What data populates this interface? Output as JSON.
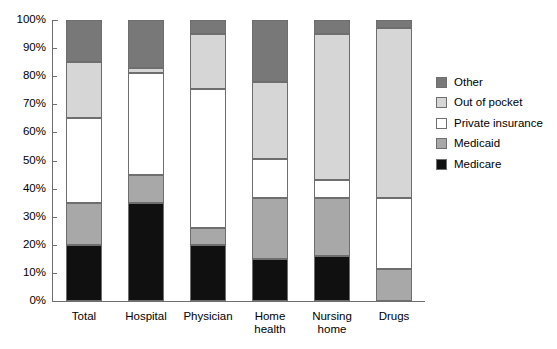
{
  "chart_data": {
    "type": "bar",
    "title": "",
    "subtitle": "",
    "xlabel": "",
    "ylabel": "",
    "stacked": true,
    "stack_total": 100,
    "grid": false,
    "legend_position": "right",
    "ylim": [
      0,
      100
    ],
    "ytick_labels": [
      "100%",
      "90%",
      "80%",
      "70%",
      "60%",
      "50%",
      "40%",
      "30%",
      "20%",
      "10%",
      "0%"
    ],
    "ytick_values": [
      100,
      90,
      80,
      70,
      60,
      50,
      40,
      30,
      20,
      10,
      0
    ],
    "categories": [
      "Total",
      "Hospital",
      "Physician",
      "Home\nhealth",
      "Nursing\nhome",
      "Drugs"
    ],
    "series": [
      {
        "name": "Medicare",
        "color": "#101010",
        "values": [
          20,
          35,
          20,
          15,
          16,
          0
        ]
      },
      {
        "name": "Medicaid",
        "color": "#a8a8a8",
        "values": [
          15,
          10,
          6,
          21.5,
          20.5,
          11.5
        ]
      },
      {
        "name": "Private insurance",
        "color": "#ffffff",
        "values": [
          30,
          36,
          49.5,
          14,
          6.5,
          25
        ]
      },
      {
        "name": "Out of pocket",
        "color": "#d6d6d6",
        "values": [
          20,
          2,
          19.5,
          27.5,
          52,
          60.5
        ]
      },
      {
        "name": "Other",
        "color": "#787878",
        "values": [
          15,
          17,
          5,
          22,
          5,
          3
        ]
      }
    ],
    "legend_order": [
      "Other",
      "Out of pocket",
      "Private insurance",
      "Medicaid",
      "Medicare"
    ]
  },
  "legend": {
    "items": [
      {
        "label": "Other",
        "color": "#787878"
      },
      {
        "label": "Out of pocket",
        "color": "#d6d6d6"
      },
      {
        "label": "Private insurance",
        "color": "#ffffff"
      },
      {
        "label": "Medicaid",
        "color": "#a8a8a8"
      },
      {
        "label": "Medicare",
        "color": "#101010"
      }
    ]
  }
}
